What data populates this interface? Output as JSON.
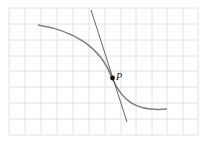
{
  "figure": {
    "grid": {
      "x_lines": [
        9,
        25,
        41,
        57,
        73,
        89,
        105,
        121,
        136,
        152,
        167,
        183,
        198
      ],
      "y_lines": [
        8,
        24,
        40,
        56,
        71,
        87,
        103,
        119,
        135
      ],
      "left": 9,
      "right": 198,
      "top": 8,
      "bottom": 135,
      "color": "#e2e2e2"
    },
    "curve": {
      "path": "M 38 25 C 70 30, 100 45, 112 78 C 122 100, 135 112, 167 109",
      "color": "#808080"
    },
    "tangent": {
      "x1": 91,
      "y1": 10,
      "x2": 127,
      "y2": 122,
      "color": "#555555"
    },
    "point": {
      "x": 112.5,
      "y": 78,
      "r": 2.4,
      "label": "P",
      "label_x": 116,
      "label_y": 80
    }
  }
}
